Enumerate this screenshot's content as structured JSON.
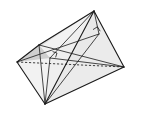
{
  "figure": {
    "kind": "geometry-solid-diagram",
    "orientation": "horizontally-mirrored",
    "background_color": "#ffffff",
    "stroke_color": "#1a1a1a",
    "face_fill_light": "#f0f0f0",
    "face_fill_mid": "#e2e2e2",
    "face_fill_dark": "#d2d2d2",
    "face_fill_darker": "#c6c6c6",
    "labels": {
      "apex": "D",
      "foot_h": "H",
      "left_upper": "E",
      "left_vertex": "B",
      "right_vertex": "C",
      "bottom_vertex": "V",
      "interior": "A"
    },
    "vertices": [
      {
        "name": "D",
        "label": "D",
        "x": 94,
        "y": 11,
        "label_x": 93,
        "label_y": 9
      },
      {
        "name": "H",
        "label": "H",
        "x": 99,
        "y": 34,
        "label_x": 109,
        "label_y": 32
      },
      {
        "name": "E",
        "label": "E",
        "x": 39,
        "y": 45,
        "label_x": 35,
        "label_y": 44
      },
      {
        "name": "B",
        "label": "B",
        "x": 17,
        "y": 62,
        "label_x": 10,
        "label_y": 62
      },
      {
        "name": "C",
        "label": "C",
        "x": 124,
        "y": 67,
        "label_x": 133,
        "label_y": 66
      },
      {
        "name": "V",
        "label": "V",
        "x": 45,
        "y": 104,
        "label_x": 44,
        "label_y": 113
      },
      {
        "name": "A",
        "label": "A",
        "x": 50,
        "y": 58,
        "label_x": 50,
        "label_y": 58
      }
    ],
    "solid_edges": [
      {
        "name": "edge-B-E",
        "from": "B",
        "to": "E"
      },
      {
        "name": "edge-E-D",
        "from": "E",
        "to": "D"
      },
      {
        "name": "edge-D-C",
        "from": "D",
        "to": "C"
      },
      {
        "name": "edge-C-V",
        "from": "C",
        "to": "V"
      },
      {
        "name": "edge-V-B",
        "from": "V",
        "to": "B"
      },
      {
        "name": "edge-D-V",
        "from": "D",
        "to": "V"
      }
    ],
    "inner_edges": [
      {
        "name": "edge-D-H",
        "from": "D",
        "to": "H"
      },
      {
        "name": "edge-H-V",
        "from": "H",
        "to": "V"
      },
      {
        "name": "edge-H-B",
        "from": "H",
        "to": "B"
      },
      {
        "name": "edge-D-A",
        "from": "D",
        "to": "A"
      },
      {
        "name": "edge-A-V",
        "from": "A",
        "to": "V"
      },
      {
        "name": "edge-A-C",
        "from": "A",
        "to": "C"
      },
      {
        "name": "edge-E-V",
        "from": "E",
        "to": "V"
      },
      {
        "name": "edge-E-C",
        "from": "E",
        "to": "C"
      }
    ],
    "dashed_edges": [
      {
        "name": "edge-B-C-hidden",
        "from": "B",
        "to": "C"
      }
    ],
    "right_angles": [
      {
        "name": "right-angle-at-H",
        "at": "H"
      },
      {
        "name": "right-angle-at-A",
        "at": "A"
      }
    ]
  }
}
